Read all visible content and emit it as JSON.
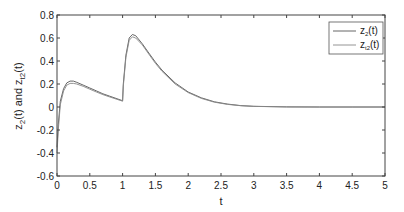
{
  "chart_data": {
    "type": "line",
    "title": "",
    "xlabel": "t",
    "ylabel": "z2(t) and zt2(t)",
    "xlim": [
      0,
      5
    ],
    "ylim": [
      -0.6,
      0.8
    ],
    "xticks": [
      "0",
      "0.5",
      "1",
      "1.5",
      "2",
      "2.5",
      "3",
      "3.5",
      "4",
      "4.5",
      "5"
    ],
    "yticks": [
      "-0.6",
      "-0.4",
      "-0.2",
      "0",
      "0.2",
      "0.4",
      "0.6",
      "0.8"
    ],
    "grid": false,
    "legend_position": "upper right",
    "x": [
      0,
      0.02,
      0.05,
      0.1,
      0.15,
      0.2,
      0.25,
      0.3,
      0.4,
      0.5,
      0.6,
      0.7,
      0.8,
      0.9,
      1.0,
      1.01,
      1.05,
      1.1,
      1.15,
      1.2,
      1.3,
      1.4,
      1.5,
      1.6,
      1.8,
      2.0,
      2.2,
      2.4,
      2.6,
      2.8,
      3.0,
      3.5,
      4.0,
      4.5,
      5.0
    ],
    "series": [
      {
        "name": "z2(t)",
        "color": "#555555",
        "values": [
          -0.35,
          -0.15,
          0.05,
          0.16,
          0.21,
          0.225,
          0.225,
          0.215,
          0.19,
          0.165,
          0.14,
          0.115,
          0.095,
          0.075,
          0.055,
          0.2,
          0.45,
          0.6,
          0.63,
          0.62,
          0.55,
          0.47,
          0.39,
          0.32,
          0.21,
          0.13,
          0.08,
          0.045,
          0.025,
          0.012,
          0.006,
          0.001,
          0.0,
          0.0,
          0.0
        ]
      },
      {
        "name": "zt2(t)",
        "color": "#888888",
        "values": [
          -0.4,
          -0.2,
          0.02,
          0.14,
          0.19,
          0.205,
          0.205,
          0.2,
          0.18,
          0.155,
          0.13,
          0.108,
          0.088,
          0.07,
          0.05,
          0.18,
          0.43,
          0.58,
          0.61,
          0.6,
          0.54,
          0.46,
          0.38,
          0.31,
          0.2,
          0.125,
          0.075,
          0.042,
          0.023,
          0.011,
          0.005,
          0.001,
          0.0,
          0.0,
          0.0
        ]
      }
    ]
  },
  "legend": {
    "items": [
      {
        "main": "z",
        "sub": "2",
        "suffix": "(t)"
      },
      {
        "main": "z",
        "sub": "t2",
        "suffix": "(t)"
      }
    ]
  },
  "axes": {
    "xlabel": "t",
    "ylabel": {
      "part1": "z",
      "sub1": "2",
      "mid": "(t) and z",
      "sub2": "t2",
      "end": "(t)"
    }
  }
}
